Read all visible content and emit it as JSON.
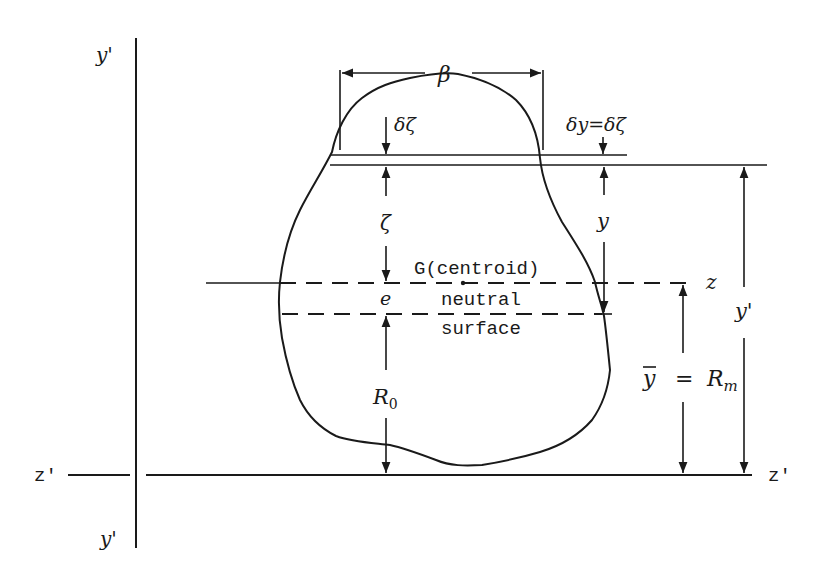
{
  "figure": {
    "labels": {
      "axis_y_prime_top": "y'",
      "axis_y_prime_bottom": "y'",
      "axis_z_prime_left": "z'",
      "axis_z_prime_right": "z'",
      "axis_z": "z",
      "width": "β",
      "strip_thickness": "δζ",
      "strip_relation": "δy=δζ",
      "zeta": "ζ",
      "y": "y",
      "y_prime_dim": "y'",
      "centroid": "G(centroid)",
      "eccentricity": "e",
      "neutral_1": "neutral",
      "neutral_2": "surface",
      "R0": "R",
      "R0_sub": "0",
      "ybar": "y",
      "equals": "=",
      "Rm": "R",
      "Rm_sub": "m"
    }
  }
}
